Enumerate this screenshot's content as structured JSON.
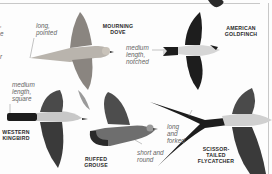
{
  "page": {
    "birds": [
      {
        "id": "mourning-dove",
        "name": "MOURNING\nDOVE",
        "tail_note": "long,\npointed"
      },
      {
        "id": "american-goldfinch",
        "name": "AMERICAN\nGOLDFINCH",
        "tail_note": "medium\nlength,\nnotched"
      },
      {
        "id": "western-kingbird",
        "name": "WESTERN\nKINGBIRD",
        "tail_note": "medium\nlength,\nsquare"
      },
      {
        "id": "ruffed-grouse",
        "name": "RUFFED\nGROUSE",
        "tail_note": "short and\nround"
      },
      {
        "id": "scissor-tailed-flycatcher",
        "name": "SCISSOR-\nTAILED\nFLYCATCHER",
        "tail_note": "long\nand\nforked"
      }
    ],
    "edge_fragments": [
      ",",
      "e",
      "r"
    ]
  },
  "colors": {
    "background": "#fdfdfd",
    "rule": "#c8c8c8",
    "label_text": "#2a2a2a",
    "note_text": "#666666",
    "dove_body": "#b9b4ad",
    "dark_wing": "#1d1d1d",
    "gray_wing": "#5a5a5a",
    "pale_body": "#d8d8d8"
  }
}
